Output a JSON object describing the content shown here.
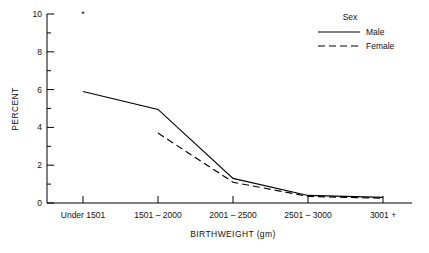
{
  "chart_data": {
    "type": "line",
    "title": "",
    "xlabel": "BIRTHWEIGHT (gm)",
    "ylabel": "PERCENT",
    "categories": [
      "Under 1501",
      "1501 – 2000",
      "2001 – 2500",
      "2501 – 3000",
      "3001 +"
    ],
    "series": [
      {
        "name": "Male",
        "style": "solid",
        "values": [
          5.9,
          4.95,
          1.3,
          0.4,
          0.3
        ]
      },
      {
        "name": "Female",
        "style": "dashed",
        "values": [
          null,
          3.7,
          1.1,
          0.35,
          0.25
        ]
      }
    ],
    "ylim": [
      0,
      10
    ],
    "yticks": [
      0,
      2,
      4,
      6,
      8,
      10
    ],
    "ytick_labels": [
      "0",
      "2",
      "4",
      "6",
      "8",
      "10"
    ],
    "yminor_ticks": [
      1,
      3,
      5,
      7,
      9
    ],
    "grid": false,
    "legend": {
      "title": "Sex",
      "position": "top-right",
      "entries": [
        "Male",
        "Female"
      ]
    },
    "annotations": [
      {
        "text": "*",
        "x_category": "Under 1501",
        "y": 10.35,
        "note": "asterisk marker above Under 1501"
      }
    ]
  },
  "axes": {
    "y_tick_0": "0",
    "y_tick_2": "2",
    "y_tick_4": "4",
    "y_tick_6": "6",
    "y_tick_8": "8",
    "y_tick_10": "10",
    "y_title": "PERCENT",
    "x_title": "BIRTHWEIGHT (gm)",
    "x_cat_0": "Under 1501",
    "x_cat_1": "1501 – 2000",
    "x_cat_2": "2001 – 2500",
    "x_cat_3": "2501 – 3000",
    "x_cat_4": "3001 +"
  },
  "legend": {
    "title": "Sex",
    "male": "Male",
    "female": "Female"
  },
  "annotation": {
    "asterisk": "*"
  },
  "colors": {
    "ink": "#000000",
    "background": "#ffffff"
  }
}
